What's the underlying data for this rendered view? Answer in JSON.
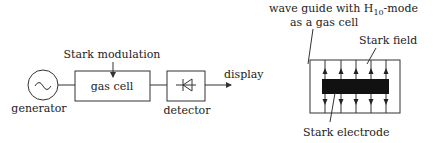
{
  "left_diagram": {
    "modulation_label": "Stark modulation",
    "generator_label": "generator",
    "generator_symbol": "~",
    "gas_cell_label": "gas cell",
    "detector_label": "detector",
    "output_label": "display"
  },
  "right_diagram": {
    "title_line1": "wave guide with H",
    "title_sub": "10",
    "title_line1_suffix": "-mode",
    "title_line2": "as a gas cell",
    "field_label": "Stark field",
    "electrode_label": "Stark electrode"
  },
  "colors": {
    "line": "#333333",
    "electrode": "#111111",
    "background": "#ffffff"
  }
}
